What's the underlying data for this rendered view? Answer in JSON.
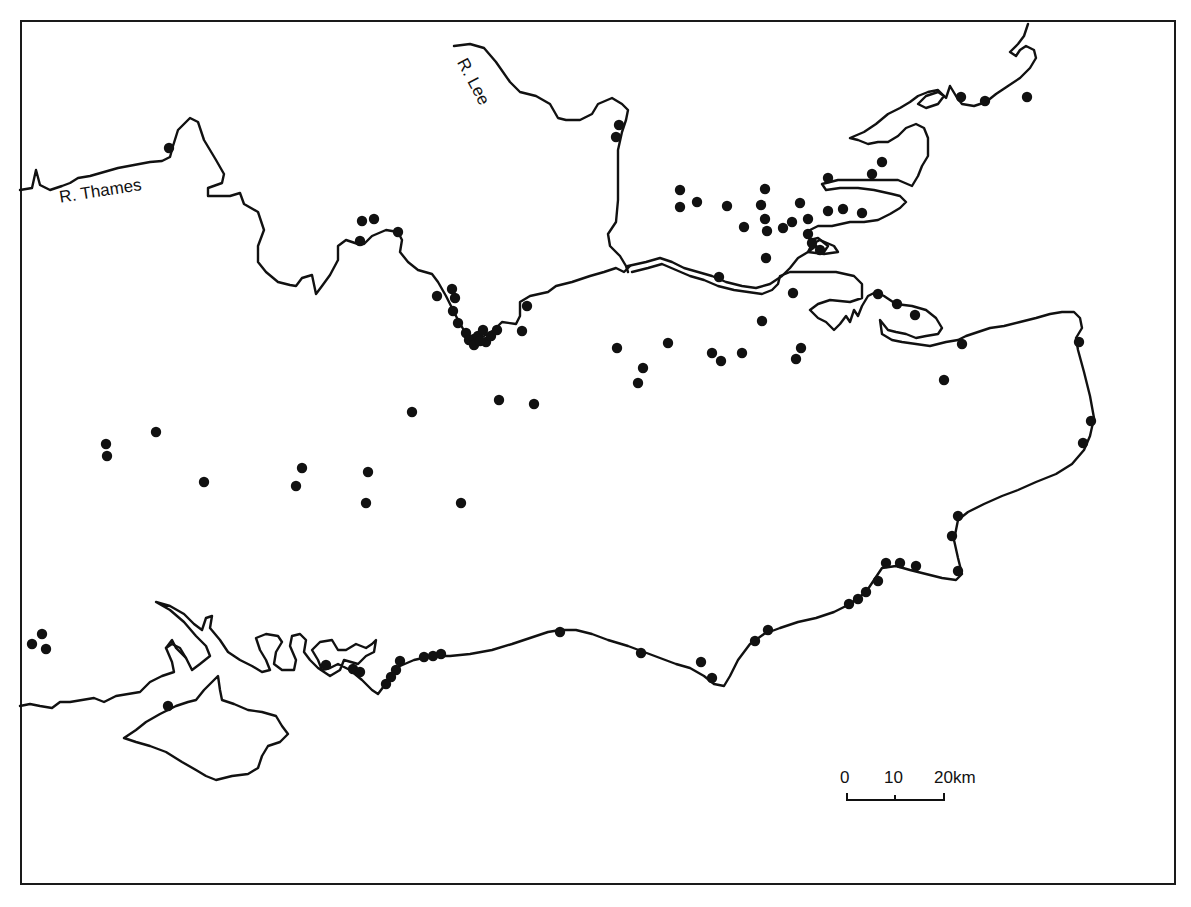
{
  "map": {
    "labels": {
      "thames": "R. Thames",
      "lee": "R. Lee"
    },
    "scale_bar": {
      "ticks": [
        "0",
        "10",
        "20km"
      ],
      "unit": "km",
      "length_km": 20
    },
    "colors": {
      "ink": "#111111",
      "background": "#ffffff"
    },
    "site_count": 118,
    "sites": [
      [
        169,
        148
      ],
      [
        1027,
        97
      ],
      [
        961,
        97
      ],
      [
        985,
        101
      ],
      [
        619,
        125
      ],
      [
        616,
        137
      ],
      [
        680,
        190
      ],
      [
        680,
        207
      ],
      [
        697,
        202
      ],
      [
        727,
        206
      ],
      [
        765,
        189
      ],
      [
        761,
        205
      ],
      [
        765,
        219
      ],
      [
        744,
        227
      ],
      [
        767,
        231
      ],
      [
        783,
        228
      ],
      [
        792,
        222
      ],
      [
        800,
        203
      ],
      [
        808,
        219
      ],
      [
        808,
        234
      ],
      [
        812,
        243
      ],
      [
        820,
        250
      ],
      [
        828,
        211
      ],
      [
        843,
        209
      ],
      [
        862,
        213
      ],
      [
        828,
        178
      ],
      [
        872,
        174
      ],
      [
        882,
        162
      ],
      [
        766,
        258
      ],
      [
        719,
        277
      ],
      [
        362,
        221
      ],
      [
        374,
        219
      ],
      [
        360,
        241
      ],
      [
        398,
        232
      ],
      [
        437,
        296
      ],
      [
        452,
        289
      ],
      [
        455,
        298
      ],
      [
        453,
        311
      ],
      [
        458,
        323
      ],
      [
        466,
        333
      ],
      [
        469,
        340
      ],
      [
        474,
        339
      ],
      [
        478,
        336
      ],
      [
        483,
        330
      ],
      [
        486,
        342
      ],
      [
        491,
        336
      ],
      [
        497,
        330
      ],
      [
        522,
        331
      ],
      [
        527,
        306
      ],
      [
        474,
        345
      ],
      [
        480,
        341
      ],
      [
        793,
        293
      ],
      [
        762,
        321
      ],
      [
        878,
        294
      ],
      [
        897,
        304
      ],
      [
        915,
        315
      ],
      [
        962,
        344
      ],
      [
        1079,
        342
      ],
      [
        944,
        380
      ],
      [
        617,
        348
      ],
      [
        668,
        343
      ],
      [
        643,
        368
      ],
      [
        638,
        383
      ],
      [
        712,
        353
      ],
      [
        721,
        361
      ],
      [
        742,
        353
      ],
      [
        801,
        348
      ],
      [
        796,
        359
      ],
      [
        499,
        400
      ],
      [
        534,
        404
      ],
      [
        412,
        412
      ],
      [
        106,
        444
      ],
      [
        107,
        456
      ],
      [
        156,
        432
      ],
      [
        204,
        482
      ],
      [
        302,
        468
      ],
      [
        296,
        486
      ],
      [
        368,
        472
      ],
      [
        366,
        503
      ],
      [
        461,
        503
      ],
      [
        1091,
        421
      ],
      [
        1083,
        443
      ],
      [
        958,
        516
      ],
      [
        952,
        536
      ],
      [
        958,
        571
      ],
      [
        886,
        563
      ],
      [
        900,
        563
      ],
      [
        916,
        566
      ],
      [
        878,
        581
      ],
      [
        866,
        592
      ],
      [
        858,
        599
      ],
      [
        849,
        604
      ],
      [
        768,
        630
      ],
      [
        755,
        641
      ],
      [
        701,
        662
      ],
      [
        712,
        678
      ],
      [
        641,
        653
      ],
      [
        560,
        632
      ],
      [
        441,
        654
      ],
      [
        433,
        656
      ],
      [
        424,
        657
      ],
      [
        400,
        661
      ],
      [
        396,
        670
      ],
      [
        391,
        677
      ],
      [
        386,
        684
      ],
      [
        353,
        669
      ],
      [
        360,
        672
      ],
      [
        326,
        665
      ],
      [
        168,
        706
      ],
      [
        42,
        634
      ],
      [
        32,
        644
      ],
      [
        46,
        649
      ]
    ]
  }
}
